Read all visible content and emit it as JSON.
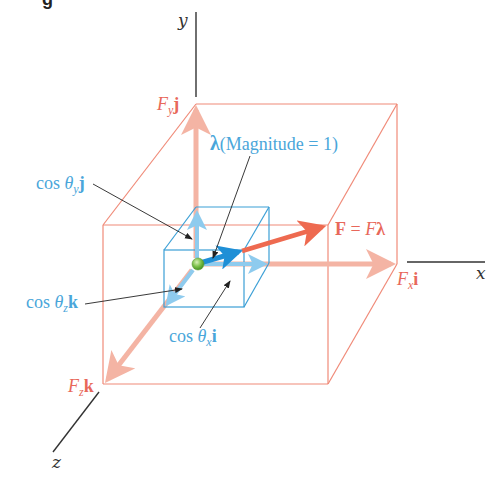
{
  "figure": {
    "cropped_header_fragment": "g",
    "axes": {
      "x": "x",
      "y": "y",
      "z": "z"
    },
    "labels": {
      "fy_j": {
        "var": "F",
        "sub": "y",
        "unit": "j"
      },
      "fx_i": {
        "var": "F",
        "sub": "x",
        "unit": "i"
      },
      "fz_k": {
        "var": "F",
        "sub": "z",
        "unit": "k"
      },
      "force_eq": {
        "lhs": "F",
        "eq": " = ",
        "rhs_var": "F",
        "rhs_vec": "λ"
      },
      "lambda": {
        "symbol": "λ",
        "text": "(Magnitude = 1)"
      },
      "cos_y": {
        "fn": "cos ",
        "theta": "θ",
        "sub": "y",
        "unit": "j"
      },
      "cos_z": {
        "fn": "cos ",
        "theta": "θ",
        "sub": "z",
        "unit": "k"
      },
      "cos_x": {
        "fn": "cos ",
        "theta": "θ",
        "sub": "x",
        "unit": "i"
      }
    },
    "colors": {
      "force_box": "#f08a78",
      "force_component": "#f4b4a4",
      "force_vector": "#ee6a50",
      "unit_box": "#3b9fd6",
      "unit_component": "#8ecbee",
      "unit_vector": "#1f8fd6",
      "label_red": "#e8685a",
      "label_blue": "#4aa6da",
      "axis": "#333333",
      "origin": "#7cc04a"
    }
  }
}
